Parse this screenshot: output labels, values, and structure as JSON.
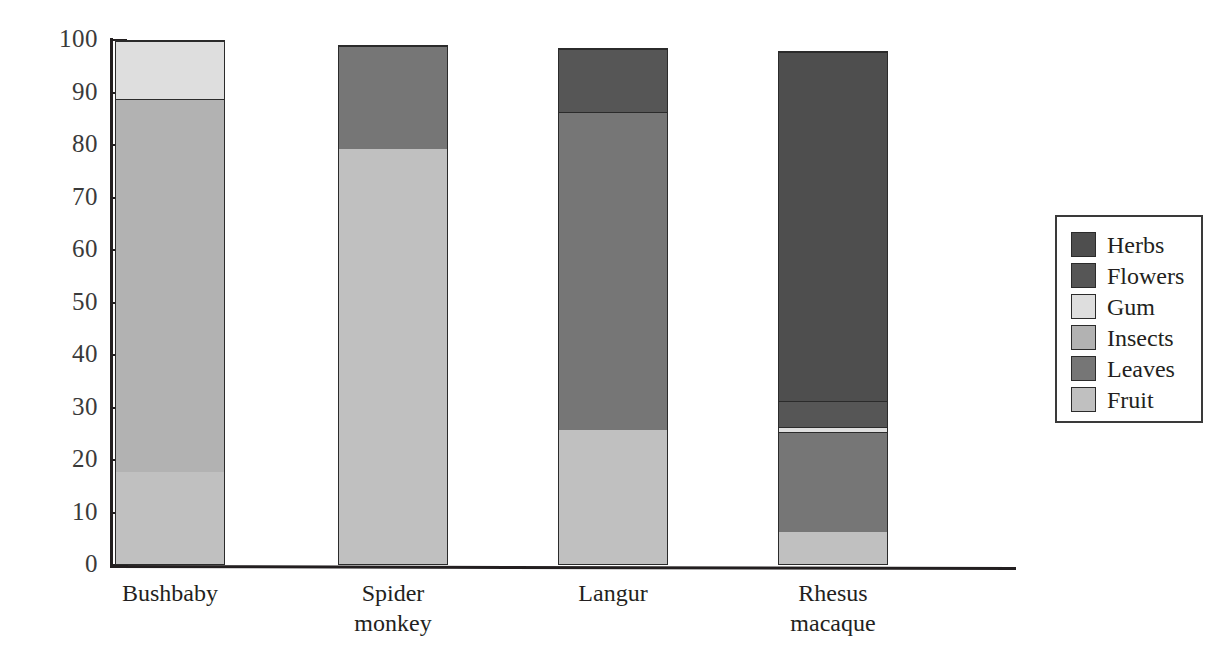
{
  "chart_data": {
    "type": "bar",
    "subtype": "stacked-bar-100",
    "title": "",
    "xlabel": "",
    "ylabel": "",
    "ylim": [
      0,
      100
    ],
    "yticks": [
      0,
      10,
      20,
      30,
      40,
      50,
      60,
      70,
      80,
      90,
      100
    ],
    "grid": false,
    "legend_position": "right",
    "categories": [
      "Bushbaby",
      "Spider monkey",
      "Langur",
      "Rhesus macaque"
    ],
    "category_labels": [
      [
        "Bushbaby"
      ],
      [
        "Spider",
        "monkey"
      ],
      [
        "Langur"
      ],
      [
        "Rhesus",
        "macaque"
      ]
    ],
    "series": [
      {
        "name": "Fruit",
        "color": "#c0c0c0",
        "values": [
          18.0,
          79.5,
          26.0,
          6.5
        ]
      },
      {
        "name": "Leaves",
        "color": "#767676",
        "values": [
          0,
          19.5,
          60.5,
          19.0
        ]
      },
      {
        "name": "Insects",
        "color": "#b2b2b2",
        "values": [
          71.0,
          0,
          0,
          0
        ]
      },
      {
        "name": "Gum",
        "color": "#dedede",
        "values": [
          11.0,
          0,
          0,
          1.0
        ]
      },
      {
        "name": "Flowers",
        "color": "#565656",
        "values": [
          0,
          0,
          12.0,
          5.0
        ]
      },
      {
        "name": "Herbs",
        "color": "#4e4e4e",
        "values": [
          0,
          0,
          0,
          66.5
        ]
      }
    ],
    "bar_totals": [
      100.0,
      99.0,
      98.5,
      98.0
    ],
    "bars": [
      {
        "category": "Bushbaby",
        "total": 100.0,
        "segments": [
          {
            "name": "Fruit",
            "from": 0,
            "to": 18.0,
            "value": 18.0,
            "color": "#c0c0c0"
          },
          {
            "name": "Insects",
            "from": 18.0,
            "to": 89.0,
            "value": 71.0,
            "color": "#b2b2b2"
          },
          {
            "name": "Gum",
            "from": 89.0,
            "to": 100.0,
            "value": 11.0,
            "color": "#dedede"
          }
        ]
      },
      {
        "category": "Spider monkey",
        "total": 99.0,
        "segments": [
          {
            "name": "Fruit",
            "from": 0,
            "to": 79.5,
            "value": 79.5,
            "color": "#c0c0c0"
          },
          {
            "name": "Leaves",
            "from": 79.5,
            "to": 99.0,
            "value": 19.5,
            "color": "#767676"
          }
        ]
      },
      {
        "category": "Langur",
        "total": 98.5,
        "segments": [
          {
            "name": "Fruit",
            "from": 0,
            "to": 26.0,
            "value": 26.0,
            "color": "#c0c0c0"
          },
          {
            "name": "Leaves",
            "from": 26.0,
            "to": 86.5,
            "value": 60.5,
            "color": "#767676"
          },
          {
            "name": "Flowers",
            "from": 86.5,
            "to": 98.5,
            "value": 12.0,
            "color": "#565656"
          }
        ]
      },
      {
        "category": "Rhesus macaque",
        "total": 98.0,
        "segments": [
          {
            "name": "Fruit",
            "from": 0,
            "to": 6.5,
            "value": 6.5,
            "color": "#c0c0c0"
          },
          {
            "name": "Leaves",
            "from": 6.5,
            "to": 25.5,
            "value": 19.0,
            "color": "#767676"
          },
          {
            "name": "Gum",
            "from": 25.5,
            "to": 26.5,
            "value": 1.0,
            "color": "#dedede"
          },
          {
            "name": "Flowers",
            "from": 26.5,
            "to": 31.5,
            "value": 5.0,
            "color": "#565656"
          },
          {
            "name": "Herbs",
            "from": 31.5,
            "to": 98.0,
            "value": 66.5,
            "color": "#4e4e4e"
          }
        ]
      }
    ],
    "legend": [
      {
        "label": "Herbs",
        "color": "#4e4e4e"
      },
      {
        "label": "Flowers",
        "color": "#565656"
      },
      {
        "label": "Gum",
        "color": "#dedede"
      },
      {
        "label": "Insects",
        "color": "#b2b2b2"
      },
      {
        "label": "Leaves",
        "color": "#767676"
      },
      {
        "label": "Fruit",
        "color": "#c0c0c0"
      }
    ]
  }
}
